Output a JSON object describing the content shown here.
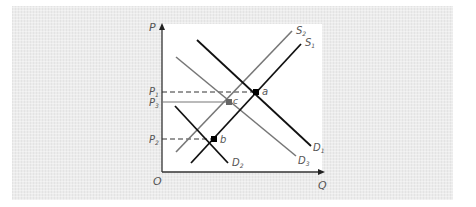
{
  "diagram": {
    "axes": {
      "y_label": "P",
      "x_label": "Q",
      "origin_label": "O"
    },
    "price_labels": [
      {
        "id": "P1",
        "text": "P",
        "sub": "1",
        "y": 92,
        "line": "dashed"
      },
      {
        "id": "P3",
        "text": "P",
        "sub": "3",
        "y": 102,
        "line": "solid"
      },
      {
        "id": "P2",
        "text": "P",
        "sub": "2",
        "y": 139,
        "line": "dashed"
      }
    ],
    "curves": [
      {
        "id": "S1",
        "text": "S",
        "sub": "1",
        "color": "#111111",
        "x1": 191,
        "y1": 163,
        "x2": 301,
        "y2": 44
      },
      {
        "id": "S2",
        "text": "S",
        "sub": "2",
        "color": "#777777",
        "x1": 176,
        "y1": 152,
        "x2": 292,
        "y2": 31
      },
      {
        "id": "D1",
        "text": "D",
        "sub": "1",
        "color": "#111111",
        "x1": 197,
        "y1": 40,
        "x2": 311,
        "y2": 146
      },
      {
        "id": "D3",
        "text": "D",
        "sub": "3",
        "color": "#777777",
        "x1": 176,
        "y1": 57,
        "x2": 296,
        "y2": 156
      },
      {
        "id": "D2",
        "text": "D",
        "sub": "2",
        "color": "#111111",
        "x1": 175,
        "y1": 106,
        "x2": 228,
        "y2": 163
      }
    ],
    "points": [
      {
        "id": "a",
        "text": "a",
        "x": 256,
        "y": 92,
        "color": "#000000"
      },
      {
        "id": "c",
        "text": "c",
        "x": 229,
        "y": 102,
        "color": "#666666"
      },
      {
        "id": "b",
        "text": "b",
        "x": 214,
        "y": 139,
        "color": "#000000"
      }
    ],
    "label_text": {
      "S1": "S",
      "S1_sub": "1",
      "S2": "S",
      "S2_sub": "2",
      "D1": "D",
      "D1_sub": "1",
      "D2": "D",
      "D2_sub": "2",
      "D3": "D",
      "D3_sub": "3",
      "P1": "P",
      "P1_sub": "1",
      "P2": "P",
      "P2_sub": "2",
      "P3": "P",
      "P3_sub": "3",
      "a": "a",
      "b": "b",
      "c": "c"
    }
  }
}
